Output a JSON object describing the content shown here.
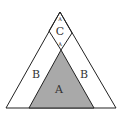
{
  "diagram": {
    "type": "nested-triangle-region-diagram",
    "colors": {
      "background": "#ffffff",
      "stroke": "#222222",
      "region_a_fill": "#a9a9a9",
      "label": "#333333"
    },
    "regions": {
      "a": {
        "label": "A"
      },
      "b_left": {
        "label": "B"
      },
      "b_right": {
        "label": "B"
      },
      "c": {
        "label": "C"
      },
      "c_top_small": {
        "label": "A"
      },
      "c_bottom_small": {
        "label": "A"
      }
    }
  }
}
